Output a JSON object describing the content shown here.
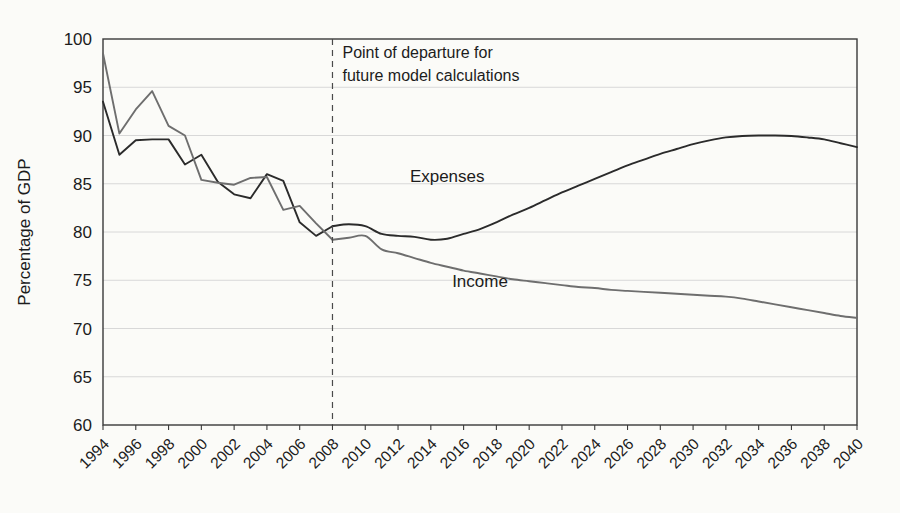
{
  "chart_data": {
    "type": "line",
    "title": "",
    "xlabel": "",
    "ylabel": "Percentage of GDP",
    "ylim": [
      60,
      100
    ],
    "xlim": [
      1994,
      2040
    ],
    "ytick_labels": [
      "100",
      "95",
      "90",
      "85",
      "80",
      "75",
      "70",
      "65",
      "60"
    ],
    "yticks": [
      100,
      95,
      90,
      85,
      80,
      75,
      70,
      65,
      60
    ],
    "xtick_labels": [
      "1994",
      "1996",
      "1998",
      "2000",
      "2002",
      "2004",
      "2006",
      "2008",
      "2010",
      "2012",
      "2014",
      "2016",
      "2018",
      "2020",
      "2022",
      "2024",
      "2026",
      "2028",
      "2030",
      "2032",
      "2034",
      "2036",
      "2038",
      "2040"
    ],
    "xticks": [
      1994,
      1996,
      1998,
      2000,
      2002,
      2004,
      2006,
      2008,
      2010,
      2012,
      2014,
      2016,
      2018,
      2020,
      2022,
      2024,
      2026,
      2028,
      2030,
      2032,
      2034,
      2036,
      2038,
      2040
    ],
    "grid": true,
    "legend_position": "inline-annotation",
    "x": [
      1994,
      1995,
      1996,
      1997,
      1998,
      1999,
      2000,
      2001,
      2002,
      2003,
      2004,
      2005,
      2006,
      2007,
      2008,
      2009,
      2010,
      2011,
      2012,
      2013,
      2014,
      2015,
      2016,
      2017,
      2018,
      2019,
      2020,
      2021,
      2022,
      2023,
      2024,
      2025,
      2026,
      2027,
      2028,
      2029,
      2030,
      2031,
      2032,
      2033,
      2034,
      2035,
      2036,
      2037,
      2038,
      2039,
      2040
    ],
    "series": [
      {
        "name": "Expenses",
        "color": "#2b2b2b",
        "values": [
          93.5,
          88.0,
          89.5,
          89.6,
          89.6,
          87.0,
          88.0,
          85.2,
          83.9,
          83.5,
          86.0,
          85.3,
          81.0,
          79.6,
          80.6,
          80.8,
          80.6,
          79.8,
          79.6,
          79.5,
          79.2,
          79.3,
          79.8,
          80.3,
          81.0,
          81.8,
          82.5,
          83.3,
          84.1,
          84.8,
          85.5,
          86.2,
          86.9,
          87.5,
          88.1,
          88.6,
          89.1,
          89.5,
          89.8,
          89.95,
          90.0,
          90.0,
          89.95,
          89.8,
          89.6,
          89.2,
          88.8
        ]
      },
      {
        "name": "Income",
        "color": "#6e6e6e",
        "values": [
          98.5,
          90.2,
          92.7,
          94.6,
          91.0,
          90.0,
          85.4,
          85.1,
          84.9,
          85.6,
          85.7,
          82.3,
          82.7,
          80.9,
          79.2,
          79.4,
          79.6,
          78.2,
          77.8,
          77.3,
          76.8,
          76.4,
          76.0,
          75.7,
          75.4,
          75.1,
          74.9,
          74.7,
          74.5,
          74.3,
          74.2,
          74.0,
          73.9,
          73.8,
          73.7,
          73.6,
          73.5,
          73.4,
          73.3,
          73.1,
          72.8,
          72.5,
          72.2,
          71.9,
          71.6,
          71.3,
          71.1
        ]
      }
    ],
    "annotations": [
      {
        "name": "point-of-departure",
        "line1": "Point of departure for",
        "line2": "future model calculations",
        "x_value": 2008,
        "style": "dashed-vertical"
      },
      {
        "name": "expenses-label",
        "text": "Expenses",
        "x_value": 2015,
        "y_value": 85.2
      },
      {
        "name": "income-label",
        "text": "Income",
        "x_value": 2017,
        "y_value": 74.3
      }
    ],
    "colors": {
      "expenses": "#2b2b2b",
      "income": "#6e6e6e",
      "grid": "#d8d8d8",
      "axis": "#3a3a3a",
      "background": "#fbfbf8"
    }
  }
}
